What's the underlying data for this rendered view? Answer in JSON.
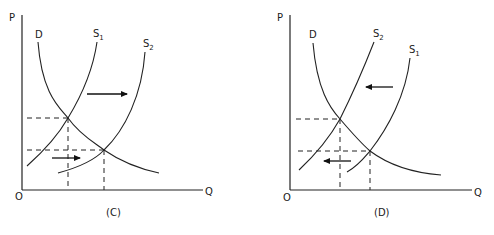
{
  "figures": [
    {
      "id": "C",
      "caption": "(C)",
      "axes": {
        "y_label": "P",
        "x_label": "Q",
        "origin_label": "O"
      },
      "curves": [
        {
          "name": "D",
          "label": "D",
          "subscript": ""
        },
        {
          "name": "S1",
          "label": "S",
          "subscript": "1"
        },
        {
          "name": "S2",
          "label": "S",
          "subscript": "2"
        }
      ],
      "shift_direction": "right"
    },
    {
      "id": "D",
      "caption": "(D)",
      "axes": {
        "y_label": "P",
        "x_label": "Q",
        "origin_label": "O"
      },
      "curves": [
        {
          "name": "D",
          "label": "D",
          "subscript": ""
        },
        {
          "name": "S2",
          "label": "S",
          "subscript": "2"
        },
        {
          "name": "S1",
          "label": "S",
          "subscript": "1"
        }
      ],
      "shift_direction": "left"
    }
  ],
  "colors": {
    "line": "#222222",
    "background": "#ffffff"
  }
}
